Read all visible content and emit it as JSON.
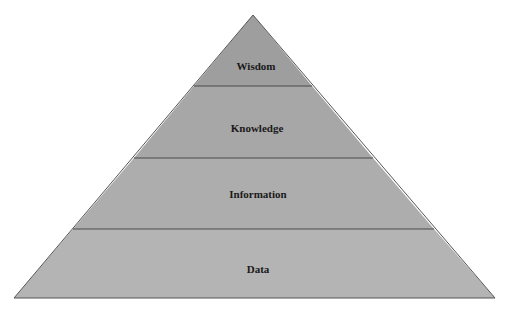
{
  "diagram": {
    "type": "pyramid",
    "tiers": [
      {
        "label": "Wisdom",
        "color": "#9e9e9e"
      },
      {
        "label": "Knowledge",
        "color": "#a7a7a7"
      },
      {
        "label": "Information",
        "color": "#adadad"
      },
      {
        "label": "Data",
        "color": "#b4b4b4"
      }
    ],
    "outline_color": "#555555",
    "background": "#ffffff"
  }
}
